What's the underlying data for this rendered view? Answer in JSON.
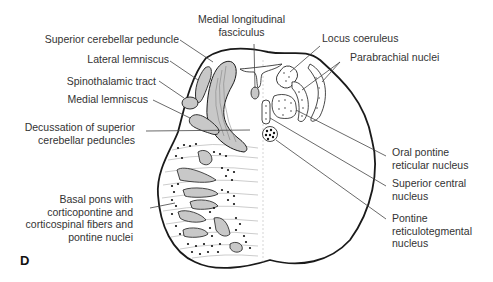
{
  "figure": {
    "panel_letter": "D"
  },
  "labels_left": [
    {
      "id": "superior-cerebellar-peduncle",
      "lines": [
        "Superior cerebellar peduncle"
      ]
    },
    {
      "id": "lateral-lemniscus",
      "lines": [
        "Lateral lemniscus"
      ]
    },
    {
      "id": "spinothalamic-tract",
      "lines": [
        "Spinothalamic tract"
      ]
    },
    {
      "id": "medial-lemniscus",
      "lines": [
        "Medial lemniscus"
      ]
    },
    {
      "id": "decussation",
      "lines": [
        "Decussation of superior",
        "cerebellar peduncles"
      ]
    },
    {
      "id": "basal-pons",
      "lines": [
        "Basal pons with",
        "corticopontine and",
        "corticospinal fibers and",
        "pontine nuclei"
      ]
    }
  ],
  "labels_top": [
    {
      "id": "mlf",
      "lines": [
        "Medial longitudinal",
        "fasciculus"
      ]
    },
    {
      "id": "locus-coeruleus",
      "lines": [
        "Locus coeruleus"
      ]
    },
    {
      "id": "parabrachial",
      "lines": [
        "Parabrachial nuclei"
      ]
    }
  ],
  "labels_right": [
    {
      "id": "oral-pontine",
      "lines": [
        "Oral pontine",
        "reticular nucleus"
      ]
    },
    {
      "id": "superior-central",
      "lines": [
        "Superior central",
        "nucleus"
      ]
    },
    {
      "id": "pontine-reticulotegmental",
      "lines": [
        "Pontine",
        "reticulotegmental",
        "nucleus"
      ]
    }
  ],
  "colors": {
    "outline": "#1a1a1a",
    "fill_gray": "#c8c8c8",
    "leader": "#444444",
    "text": "#333333"
  }
}
